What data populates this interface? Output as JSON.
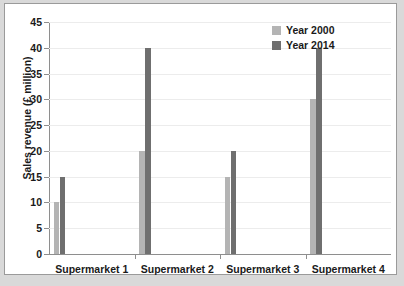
{
  "chart_data": {
    "type": "bar",
    "title": "",
    "xlabel": "",
    "ylabel": "Sales revenue (£ million)",
    "categories": [
      "Supermarket 1",
      "Supermarket 2",
      "Supermarket 3",
      "Supermarket 4"
    ],
    "series": [
      {
        "name": "Year 2000",
        "color": "#b4b4b4",
        "values": [
          10,
          20,
          15,
          30
        ]
      },
      {
        "name": "Year 2014",
        "color": "#6f6f6f",
        "values": [
          15,
          40,
          20,
          40
        ]
      }
    ],
    "ylim": [
      0,
      45
    ],
    "ytick_values": [
      0,
      5,
      10,
      15,
      20,
      25,
      30,
      35,
      40,
      45
    ],
    "ytick_labels": [
      "0",
      "5",
      "10",
      "15",
      "20",
      "25",
      "30",
      "35",
      "40",
      "45"
    ],
    "grid": true,
    "legend_position": "top-right"
  }
}
